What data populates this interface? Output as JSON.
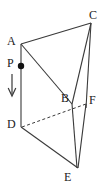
{
  "figure": {
    "type": "geometry-diagram",
    "background_color": "#ffffff",
    "stroke_color": "#3a3a3a",
    "label_color": "#1a1a1a",
    "canvas": {
      "width": 108,
      "height": 189
    }
  },
  "labels": {
    "A": "A",
    "B": "B",
    "C": "C",
    "D": "D",
    "E": "E",
    "F": "F",
    "P": "P"
  },
  "vertices": [
    {
      "name": "A",
      "x": 21,
      "y": 44
    },
    {
      "name": "B",
      "x": 72,
      "y": 104
    },
    {
      "name": "C",
      "x": 91,
      "y": 23
    },
    {
      "name": "D",
      "x": 21,
      "y": 127
    },
    {
      "name": "E",
      "x": 78,
      "y": 168
    },
    {
      "name": "F",
      "x": 86,
      "y": 104
    }
  ],
  "point_p": {
    "name": "P",
    "x": 21,
    "y": 66,
    "radius": 3.2,
    "on_edge": "AD"
  },
  "arrow": {
    "name": "downward-arrow",
    "x": 12,
    "y_start": 74,
    "y_end": 96,
    "direction": "down"
  },
  "label_positions": {
    "A": {
      "x": 7,
      "y": 36
    },
    "B": {
      "x": 61,
      "y": 93
    },
    "C": {
      "x": 91,
      "y": 10
    },
    "D": {
      "x": 7,
      "y": 119
    },
    "E": {
      "x": 65,
      "y": 172
    },
    "F": {
      "x": 90,
      "y": 95
    },
    "P": {
      "x": 7,
      "y": 58
    }
  },
  "edges": [
    {
      "name": "AC",
      "from": "A",
      "to": "C",
      "style": "solid"
    },
    {
      "name": "AB",
      "from": "A",
      "to": "B",
      "style": "solid"
    },
    {
      "name": "BC",
      "from": "B",
      "to": "C",
      "style": "solid"
    },
    {
      "name": "AD",
      "from": "A",
      "to": "D",
      "style": "solid"
    },
    {
      "name": "BE",
      "from": "B",
      "to": "E",
      "style": "solid"
    },
    {
      "name": "CF",
      "from": "C",
      "to": "F",
      "style": "solid"
    },
    {
      "name": "DE",
      "from": "D",
      "to": "E",
      "style": "solid"
    },
    {
      "name": "EF",
      "from": "E",
      "to": "F",
      "style": "solid"
    },
    {
      "name": "DF",
      "from": "D",
      "to": "F",
      "style": "dashed"
    }
  ]
}
